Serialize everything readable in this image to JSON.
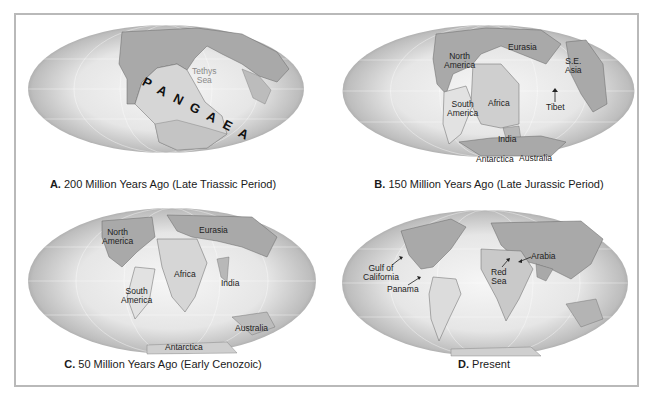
{
  "figure": {
    "panels": [
      {
        "letter": "A.",
        "caption": "200 Million Years Ago (Late Triassic Period)",
        "labels": {
          "supercontinent": "PANGAEA",
          "sea_line1": "Tethys",
          "sea_line2": "Sea"
        }
      },
      {
        "letter": "B.",
        "caption": "150 Million Years Ago (Late Jurassic Period)",
        "labels": {
          "north_america_1": "North",
          "north_america_2": "America",
          "eurasia": "Eurasia",
          "se_asia_1": "S.E.",
          "se_asia_2": "Asia",
          "south_america_1": "South",
          "south_america_2": "America",
          "africa": "Africa",
          "tibet": "Tibet",
          "india": "India",
          "antarctica": "Antarctica",
          "australia": "Australia"
        }
      },
      {
        "letter": "C.",
        "caption": "50 Million Years Ago (Early Cenozoic)",
        "labels": {
          "north_america_1": "North",
          "north_america_2": "America",
          "eurasia": "Eurasia",
          "africa": "Africa",
          "india": "India",
          "south_america_1": "South",
          "south_america_2": "America",
          "australia": "Australia",
          "antarctica": "Antarctica"
        }
      },
      {
        "letter": "D.",
        "caption": "Present",
        "labels": {
          "gulf_1": "Gulf of",
          "gulf_2": "California",
          "panama": "Panama",
          "red_sea_1": "Red",
          "red_sea_2": "Sea",
          "arabia": "Arabia"
        }
      }
    ],
    "colors": {
      "frame_border": "#b9b9b9",
      "ocean_center": "#f4f4f4",
      "ocean_edge": "#8c8c8c",
      "land_dark": "#a9a9a9",
      "land_light": "#d6d6d6"
    }
  }
}
